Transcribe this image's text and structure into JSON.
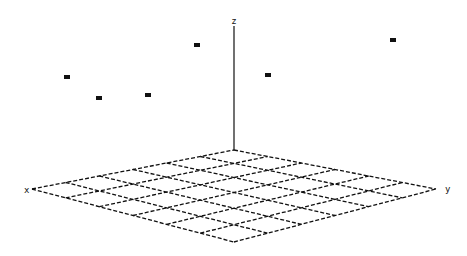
{
  "chart_data": {
    "type": "scatter",
    "projection": "3d-perspective",
    "title": "",
    "axes": {
      "x": {
        "label": "x",
        "label_pos": [
          24,
          193
        ]
      },
      "y": {
        "label": "y",
        "label_pos": [
          445,
          192
        ]
      },
      "z": {
        "label": "z",
        "label_pos": [
          234,
          24
        ]
      }
    },
    "floor_grid": {
      "divisions": 6,
      "corners": {
        "left": [
          32,
          189
        ],
        "back": [
          234,
          150
        ],
        "right": [
          436,
          189
        ],
        "front": [
          234,
          242
        ]
      },
      "line_style": "dashed"
    },
    "z_axis_line": {
      "from": [
        234,
        150
      ],
      "to": [
        234,
        26
      ]
    },
    "points_screen": [
      {
        "id": 1,
        "x": 67,
        "y": 77
      },
      {
        "id": 2,
        "x": 99,
        "y": 98
      },
      {
        "id": 3,
        "x": 148,
        "y": 95
      },
      {
        "id": 4,
        "x": 197,
        "y": 45
      },
      {
        "id": 5,
        "x": 268,
        "y": 75
      },
      {
        "id": 6,
        "x": 393,
        "y": 40
      }
    ],
    "grid": true,
    "legend": null
  },
  "colors": {
    "ink": "#111111",
    "background": "#ffffff"
  }
}
